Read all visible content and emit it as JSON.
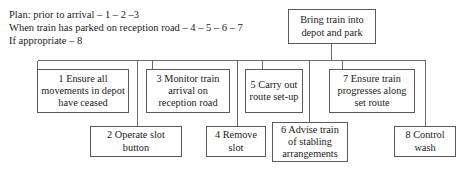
{
  "diagram": {
    "legend": {
      "line1": "Plan: prior to arrival – 1 – 2 –3",
      "line2": "When train has parked on reception road – 4 – 5 – 6 – 7",
      "line3": "If appropriate – 8"
    },
    "root": {
      "label": "Bring train into depot and park"
    },
    "nodes": [
      {
        "id": "node-1",
        "label": "1 Ensure all movements in depot have ceased"
      },
      {
        "id": "node-2",
        "label": "2 Operate slot button"
      },
      {
        "id": "node-3",
        "label": "3 Monitor train arrival on reception road"
      },
      {
        "id": "node-4",
        "label": "4 Remove slot"
      },
      {
        "id": "node-5",
        "label": "5 Carry out route set-up"
      },
      {
        "id": "node-6",
        "label": "6 Advise train of stabling arrangements"
      },
      {
        "id": "node-7",
        "label": "7 Ensure train progresses along set route"
      },
      {
        "id": "node-8",
        "label": "8 Control wash"
      }
    ],
    "colors": {
      "border": "#5a5a5a",
      "connector": "#6b6b6b",
      "background": "#ffffff",
      "text": "#1a1a1a"
    }
  }
}
